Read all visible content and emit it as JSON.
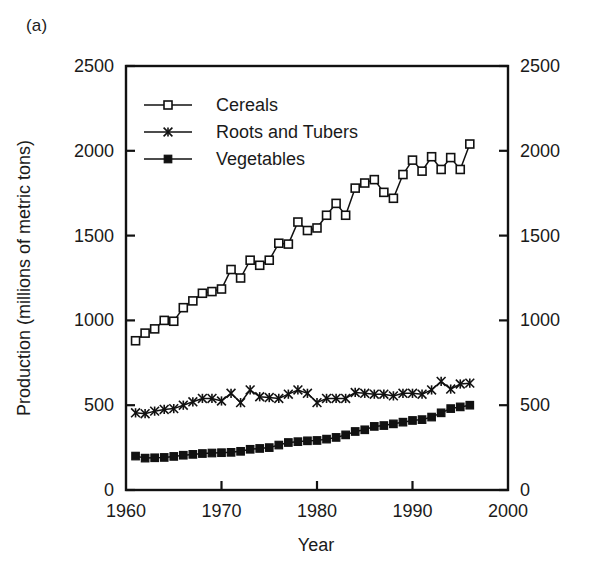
{
  "panel": {
    "label": "(a)"
  },
  "chart_data": {
    "type": "line",
    "title": "",
    "subtitle": "",
    "xlabel": "Year",
    "ylabel": "Production (millions of metric tons)",
    "xlim": [
      1960,
      2000
    ],
    "ylim": [
      0,
      2500
    ],
    "xticks": [
      1960,
      1970,
      1980,
      1990,
      2000
    ],
    "xticklabels": [
      "1960",
      "1970",
      "1980",
      "1990",
      "2000"
    ],
    "yticks": [
      0,
      500,
      1000,
      1500,
      2000,
      2500
    ],
    "yticklabels": [
      "0",
      "500",
      "1000",
      "1500",
      "2000",
      "2500"
    ],
    "right_axis_ticks": [
      0,
      500,
      1000,
      1500,
      2000,
      2500
    ],
    "right_axis_ticklabels": [
      "0",
      "500",
      "1000",
      "1500",
      "2000",
      "2500"
    ],
    "grid": false,
    "legend_position": "upper left",
    "x": [
      1961,
      1962,
      1963,
      1964,
      1965,
      1966,
      1967,
      1968,
      1969,
      1970,
      1971,
      1972,
      1973,
      1974,
      1975,
      1976,
      1977,
      1978,
      1979,
      1980,
      1981,
      1982,
      1983,
      1984,
      1985,
      1986,
      1987,
      1988,
      1989,
      1990,
      1991,
      1992,
      1993,
      1994,
      1995,
      1996
    ],
    "series": [
      {
        "name": "Cereals",
        "marker": "open-square",
        "values": [
          880,
          925,
          950,
          1000,
          995,
          1075,
          1115,
          1160,
          1170,
          1185,
          1300,
          1250,
          1355,
          1325,
          1355,
          1455,
          1450,
          1580,
          1530,
          1545,
          1620,
          1690,
          1620,
          1780,
          1810,
          1830,
          1755,
          1720,
          1860,
          1945,
          1880,
          1965,
          1890,
          1960,
          1890,
          2040
        ]
      },
      {
        "name": "Roots and Tubers",
        "marker": "cross",
        "values": [
          455,
          450,
          465,
          475,
          480,
          500,
          520,
          540,
          540,
          525,
          570,
          515,
          590,
          550,
          545,
          540,
          565,
          590,
          570,
          515,
          540,
          540,
          540,
          575,
          570,
          565,
          565,
          555,
          570,
          570,
          565,
          590,
          640,
          595,
          625,
          630
        ]
      },
      {
        "name": "Vegetables",
        "marker": "filled-square",
        "values": [
          200,
          188,
          190,
          192,
          198,
          205,
          210,
          215,
          218,
          220,
          222,
          228,
          240,
          245,
          250,
          265,
          280,
          285,
          290,
          292,
          300,
          310,
          325,
          345,
          355,
          375,
          380,
          390,
          400,
          410,
          415,
          430,
          455,
          480,
          490,
          500
        ]
      }
    ]
  },
  "legend": {
    "items": [
      {
        "label": "Cereals",
        "marker": "open-square"
      },
      {
        "label": "Roots and Tubers",
        "marker": "cross"
      },
      {
        "label": "Vegetables",
        "marker": "filled-square"
      }
    ]
  },
  "colors": {
    "ink": "#111111",
    "background": "#ffffff"
  }
}
